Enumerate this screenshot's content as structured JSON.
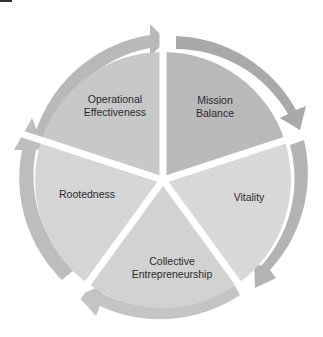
{
  "diagram": {
    "type": "cycle",
    "segments": [
      {
        "id": "operational-effectiveness",
        "label_line1": "Operational",
        "label_line2": "Effectiveness",
        "fill": "#c9c9c9"
      },
      {
        "id": "mission-balance",
        "label_line1": "Mission",
        "label_line2": "Balance",
        "fill": "#b9b9b9"
      },
      {
        "id": "vitality",
        "label_line1": "Vitality",
        "label_line2": "",
        "fill": "#d9d9d9"
      },
      {
        "id": "collective-entrepreneurship",
        "label_line1": "Collective",
        "label_line2": "Entrepreneurship",
        "fill": "#d3d3d3"
      },
      {
        "id": "rootedness",
        "label_line1": "Rootedness",
        "label_line2": "",
        "fill": "#d6d6d6"
      }
    ],
    "arrow_color": "#a9a9a9",
    "separator_color": "#ffffff"
  }
}
